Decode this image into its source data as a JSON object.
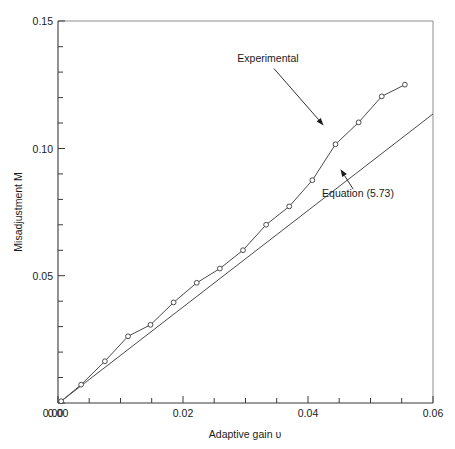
{
  "chart_data": {
    "type": "line",
    "title": "",
    "xlabel": "Adaptive gain υ",
    "ylabel": "Misadjustment M",
    "xlim": [
      0.0,
      0.06
    ],
    "ylim": [
      0.0,
      0.15
    ],
    "grid": false,
    "legend_position": "inline-annotations",
    "x_ticks_major": [
      "0.00",
      "0.02",
      "0.04",
      "0.06"
    ],
    "x_tick_values": [
      0.0,
      0.02,
      0.04,
      0.06
    ],
    "x_minor_step": 0.005,
    "y_ticks_major": [
      "0.00",
      "0.05",
      "0.10",
      "0.15"
    ],
    "y_tick_values": [
      0.0,
      0.05,
      0.1,
      0.15
    ],
    "y_minor_step": 0.01,
    "series": [
      {
        "name": "Experimental",
        "marker": "open-circle",
        "x": [
          0.0005,
          0.0037,
          0.0075,
          0.0112,
          0.0148,
          0.0185,
          0.0222,
          0.0259,
          0.0296,
          0.0333,
          0.037,
          0.0407,
          0.0444,
          0.0481,
          0.0518,
          0.0555
        ],
        "y": [
          0.0007,
          0.0072,
          0.0164,
          0.0262,
          0.0307,
          0.0395,
          0.0472,
          0.0528,
          0.06,
          0.07,
          0.0772,
          0.0875,
          0.1016,
          0.1102,
          0.1204,
          0.125
        ]
      },
      {
        "name": "Equation (5.73)",
        "marker": "none",
        "x": [
          0.0005,
          0.06
        ],
        "y": [
          0.0007,
          0.1135
        ]
      }
    ],
    "annotations": [
      {
        "text": "Experimental",
        "target_series": "Experimental",
        "text_x": 0.0336,
        "text_y": 0.134,
        "arrow_to_x": 0.0425,
        "arrow_to_y": 0.109
      },
      {
        "text": "Equation (5.73)",
        "target_series": "Equation (5.73)",
        "text_x": 0.048,
        "text_y": 0.081,
        "arrow_to_x": 0.0452,
        "arrow_to_y": 0.0918
      }
    ]
  }
}
